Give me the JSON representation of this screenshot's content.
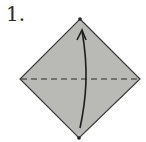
{
  "step": {
    "number": "1."
  },
  "diagram": {
    "paper_color": "#b8b8b4",
    "edge_color": "#3a3a3a",
    "shape": "square-diamond",
    "fold_line": "valley-fold-dashed-horizontal",
    "arrow": "fold-bottom-corner-up-to-top-corner",
    "markers": [
      "top-corner-dot",
      "bottom-corner-dot"
    ]
  }
}
